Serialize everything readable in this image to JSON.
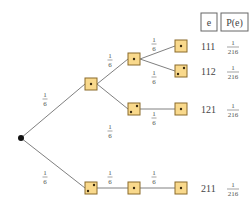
{
  "header": {
    "col_outcome": "e",
    "col_prob": "P(e)"
  },
  "branch_prob": {
    "num": "1",
    "den": "6"
  },
  "outcomes": [
    {
      "e": "111",
      "p_num": "1",
      "p_den": "216"
    },
    {
      "e": "112",
      "p_num": "1",
      "p_den": "216"
    },
    {
      "e": "121",
      "p_num": "1",
      "p_den": "216"
    },
    {
      "e": "211",
      "p_num": "1",
      "p_den": "216"
    }
  ],
  "colors": {
    "die_fill": "#f9d98c",
    "die_stroke": "#8a6a2a",
    "edge": "#808080"
  }
}
